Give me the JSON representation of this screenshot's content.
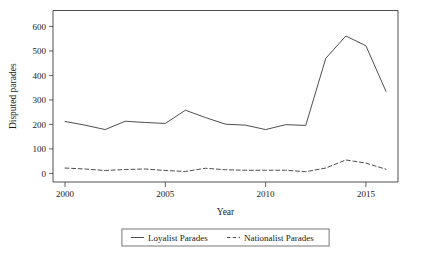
{
  "chart_data": {
    "type": "line",
    "title": "",
    "xlabel": "Year",
    "ylabel": "Disputed parades",
    "xlim": [
      1999.4,
      2016.6
    ],
    "ylim": [
      -35,
      665
    ],
    "grid": false,
    "legend_position": "bottom-center",
    "x": [
      2000,
      2001,
      2002,
      2003,
      2004,
      2005,
      2006,
      2007,
      2008,
      2009,
      2010,
      2011,
      2012,
      2013,
      2014,
      2015,
      2016
    ],
    "xticks": [
      2000,
      2005,
      2010,
      2015
    ],
    "xtick_labels": [
      "2000",
      "2005",
      "2010",
      "2015"
    ],
    "yticks": [
      0,
      100,
      200,
      300,
      400,
      500,
      600
    ],
    "ytick_labels": [
      "0",
      "100",
      "200",
      "300",
      "400",
      "500",
      "600"
    ],
    "series": [
      {
        "name": "Loyalist Parades",
        "style": "solid",
        "color": "#3a3a3a",
        "values": [
          212,
          197,
          179,
          213,
          208,
          204,
          258,
          228,
          201,
          197,
          179,
          199,
          196,
          470,
          561,
          521,
          335
        ]
      },
      {
        "name": "Nationalist Parades",
        "style": "dashed",
        "color": "#3a3a3a",
        "values": [
          22,
          18,
          12,
          16,
          18,
          12,
          8,
          21,
          15,
          13,
          13,
          13,
          7,
          22,
          55,
          42,
          17
        ]
      }
    ]
  },
  "legend": {
    "entries": [
      {
        "label": "Loyalist Parades",
        "style": "solid"
      },
      {
        "label": "Nationalist Parades",
        "style": "dashed"
      }
    ]
  }
}
